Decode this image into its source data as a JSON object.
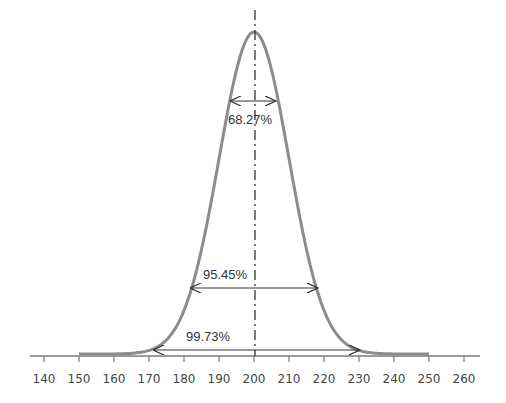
{
  "chart_data": {
    "type": "line",
    "title": "",
    "xlabel": "",
    "ylabel": "",
    "mean": 200,
    "std_dev": 10,
    "xlim": [
      135,
      265
    ],
    "x_ticks": [
      140,
      150,
      160,
      170,
      180,
      190,
      200,
      210,
      220,
      230,
      240,
      250,
      260
    ],
    "grid": false,
    "legend": null,
    "series": [
      {
        "name": "Normal distribution",
        "mean": 200,
        "sd": 10,
        "color": "#8c8c8c"
      }
    ],
    "annotations": [
      {
        "label": "68.27%",
        "from": 190,
        "to": 210,
        "sigma": 1
      },
      {
        "label": "95.45%",
        "from": 180,
        "to": 220,
        "sigma": 2
      },
      {
        "label": "99.73%",
        "from": 170,
        "to": 230,
        "sigma": 3
      }
    ],
    "mean_line": {
      "x": 200,
      "style": "dash-dot"
    }
  },
  "labels": {
    "ticks": [
      "140",
      "150",
      "160",
      "170",
      "180",
      "190",
      "200",
      "210",
      "220",
      "230",
      "240",
      "250",
      "260"
    ],
    "sigma1": "68.27%",
    "sigma2": "95.45%",
    "sigma3": "99.73%"
  },
  "colors": {
    "curve": "#8c8c8c",
    "axis": "#7a7a7a",
    "arrow": "#333333",
    "text": "#444444"
  }
}
